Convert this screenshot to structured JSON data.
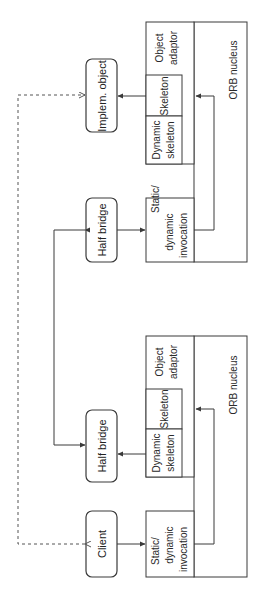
{
  "diagram": {
    "orientation": "rotated-90-ccw",
    "nodes": {
      "implem_object": "Implem. object",
      "half_bridge_server_side": "Half bridge",
      "half_bridge_client_side": "Half bridge",
      "client": "Client"
    },
    "server_stack": {
      "object_adaptor": [
        "Object",
        "adaptor"
      ],
      "skeleton": "Skeleton",
      "dynamic_skeleton": [
        "Dynamic",
        "skeleton"
      ],
      "invocation": [
        "Static/",
        "dynamic",
        "invocation"
      ],
      "orb_nucleus": "ORB nucleus"
    },
    "bridge_stack": {
      "object_adaptor": [
        "Object",
        "adaptor"
      ],
      "skeleton": "Skeleton",
      "dynamic_skeleton": [
        "Dynamic",
        "skeleton"
      ],
      "invocation": [
        "Static/",
        "dynamic",
        "invocation"
      ],
      "orb_nucleus": "ORB nucleus"
    },
    "edges": [
      {
        "from": "skeleton",
        "to": "implem_object",
        "style": "solid"
      },
      {
        "from": "half_bridge_server_side",
        "to": "invocation",
        "style": "solid"
      },
      {
        "from": "invocation",
        "to": "orb_nucleus",
        "style": "solid"
      },
      {
        "from": "half_bridge_server_side",
        "to": "half_bridge_client_side",
        "style": "solid-bidirectional"
      },
      {
        "from": "dynamic_skeleton",
        "to": "half_bridge_client_side",
        "style": "solid"
      },
      {
        "from": "client",
        "to": "invocation",
        "style": "solid"
      },
      {
        "from": "client",
        "to": "implem_object",
        "style": "dashed-bidirectional"
      }
    ],
    "colors": {
      "stroke": "#3a3a3a",
      "background": "#ffffff",
      "text": "#2a2a2a"
    }
  }
}
